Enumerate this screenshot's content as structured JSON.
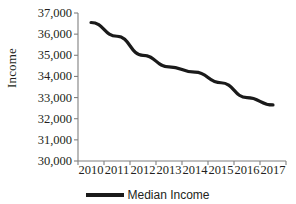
{
  "chart_data": {
    "type": "line",
    "title": "",
    "xlabel": "",
    "ylabel": "Income",
    "categories": [
      "2010",
      "2011",
      "2012",
      "2013",
      "2014",
      "2015",
      "2016",
      "2017"
    ],
    "series": [
      {
        "name": "Median Income",
        "values": [
          36550,
          35900,
          35000,
          34450,
          34200,
          33700,
          33000,
          32650
        ],
        "color": "#1a1a1a"
      }
    ],
    "ylim": [
      30000,
      37000
    ],
    "yticks": [
      30000,
      31000,
      32000,
      33000,
      34000,
      35000,
      36000,
      37000
    ],
    "ytick_labels": [
      "30,000",
      "31,000",
      "32,000",
      "33,000",
      "34,000",
      "35,000",
      "36,000",
      "37,000"
    ],
    "grid": false,
    "legend_position": "bottom",
    "axis_color": "#808080"
  },
  "legend": {
    "entries": [
      {
        "label": "Median Income",
        "color": "#1a1a1a"
      }
    ]
  }
}
